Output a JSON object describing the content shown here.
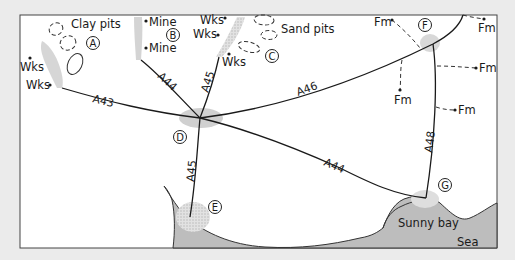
{
  "map": {
    "background": "#ebebeb",
    "land_color": "#ffffff",
    "sea_color": "#bdbdbd",
    "settlement_shade": "#cfcfcf",
    "frame": {
      "x": 20,
      "y": 15,
      "width": 477,
      "height": 233
    }
  },
  "sites": [
    {
      "id": "A",
      "label": "A"
    },
    {
      "id": "B",
      "label": "B"
    },
    {
      "id": "C",
      "label": "C"
    },
    {
      "id": "D",
      "label": "D"
    },
    {
      "id": "E",
      "label": "E"
    },
    {
      "id": "F",
      "label": "F"
    },
    {
      "id": "G",
      "label": "G"
    }
  ],
  "roads": [
    {
      "id": "A43",
      "label": "A43"
    },
    {
      "id": "A44_north",
      "label": "A44"
    },
    {
      "id": "A45_north",
      "label": "A45"
    },
    {
      "id": "A46",
      "label": "A46"
    },
    {
      "id": "A44_east",
      "label": "A44"
    },
    {
      "id": "A45_south",
      "label": "A45"
    },
    {
      "id": "A48",
      "label": "A48"
    }
  ],
  "features": {
    "clay_pits": "Clay pits",
    "sand_pits": "Sand pits",
    "sunny_bay": "Sunny bay",
    "sea": "Sea"
  },
  "points": {
    "works": [
      "Wks",
      "Wks",
      "Wks",
      "Wks",
      "Wks"
    ],
    "mines": [
      "Mine",
      "Mine"
    ],
    "farms": [
      "Fm",
      "Fm",
      "Fm",
      "Fm",
      "Fm"
    ]
  }
}
